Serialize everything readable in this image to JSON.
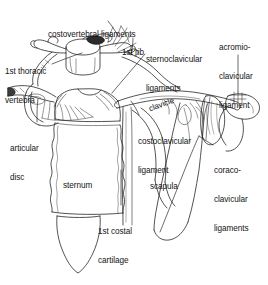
{
  "figure": {
    "style": "anatomical line drawing",
    "background_color": "#ffffff",
    "line_color": "#1a1a1a",
    "text_color": "#141414"
  },
  "labels": [
    {
      "id": "costovertebral-ligaments",
      "text": "costovertebral ligaments",
      "lines": [
        "costovertebral ligaments"
      ],
      "x": 48,
      "y": 11,
      "align": "left",
      "rotated": false
    },
    {
      "id": "first-rib",
      "text": "1st rib",
      "lines": [
        "1st rib"
      ],
      "x": 122,
      "y": 29,
      "align": "left",
      "rotated": false
    },
    {
      "id": "sternoclavicular-ligaments",
      "text": "sternoclavicular ligaments",
      "lines": [
        "sternoclavicular",
        "ligaments"
      ],
      "x": 146,
      "y": 36,
      "align": "left",
      "rotated": false
    },
    {
      "id": "acromioclavicular-ligament",
      "text": "acromio-clavicular ligament",
      "lines": [
        "acromio-",
        "clavicular",
        "ligament"
      ],
      "x": 219,
      "y": 24,
      "align": "left",
      "rotated": false
    },
    {
      "id": "first-thoracic-vertebra",
      "text": "1st thoracic vertebra",
      "lines": [
        "1st thoracic",
        "vertebra"
      ],
      "x": 5,
      "y": 48,
      "align": "left",
      "rotated": false
    },
    {
      "id": "clavicle",
      "text": "clavicle",
      "lines": [
        "clavicle"
      ],
      "x": 141,
      "y": 87,
      "align": "left",
      "rotated": true
    },
    {
      "id": "articular-disc",
      "text": "articular disc",
      "lines": [
        "articular",
        "disc"
      ],
      "x": 10,
      "y": 125,
      "align": "left",
      "rotated": false
    },
    {
      "id": "costoclavicular-ligament",
      "text": "costoclavicular ligament",
      "lines": [
        "costoclavicular",
        "ligament"
      ],
      "x": 138,
      "y": 118,
      "align": "left",
      "rotated": false
    },
    {
      "id": "coracoclavicular-ligaments",
      "text": "coraco-clavicular ligaments",
      "lines": [
        "coraco-",
        "clavicular",
        "ligaments"
      ],
      "x": 214,
      "y": 147,
      "align": "left",
      "rotated": false
    },
    {
      "id": "sternum",
      "text": "sternum",
      "lines": [
        "sternum"
      ],
      "x": 63,
      "y": 162,
      "align": "left",
      "rotated": false
    },
    {
      "id": "scapula",
      "text": "scapula",
      "lines": [
        "scapula"
      ],
      "x": 150,
      "y": 163,
      "align": "left",
      "rotated": false
    },
    {
      "id": "first-costal-cartilage",
      "text": "1st costal cartilage",
      "lines": [
        "1st costal",
        "cartilage"
      ],
      "x": 98,
      "y": 208,
      "align": "left",
      "rotated": false
    }
  ],
  "structures": [
    {
      "id": "thoracic-vertebra",
      "name": "1st thoracic vertebra"
    },
    {
      "id": "first-rib",
      "name": "1st rib"
    },
    {
      "id": "clavicle-left",
      "name": "left clavicle"
    },
    {
      "id": "clavicle-right",
      "name": "right clavicle"
    },
    {
      "id": "manubrium",
      "name": "manubrium of sternum"
    },
    {
      "id": "sternum-body",
      "name": "body of sternum"
    },
    {
      "id": "xiphoid-process",
      "name": "xiphoid process"
    },
    {
      "id": "scapula",
      "name": "scapula"
    },
    {
      "id": "acromion",
      "name": "acromion"
    },
    {
      "id": "coracoid-process",
      "name": "coracoid process"
    },
    {
      "id": "costal-cartilage",
      "name": "1st costal cartilage"
    },
    {
      "id": "articular-disc",
      "name": "articular disc"
    }
  ]
}
